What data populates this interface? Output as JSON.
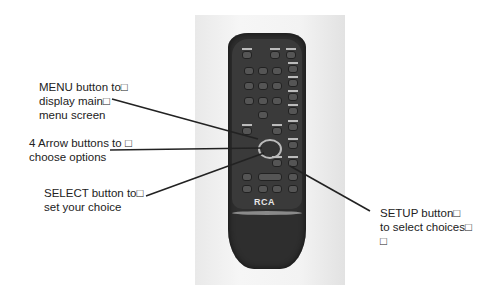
{
  "callouts": [
    {
      "id": "menu",
      "text": "MENU button to□\ndisplay main□\nmenu screen"
    },
    {
      "id": "arrows",
      "text": "4 Arrow buttons to □\nchoose options"
    },
    {
      "id": "select",
      "text": "SELECT button to□\nset your choice"
    },
    {
      "id": "setup",
      "text": "SETUP button□\nto select choices□\n□"
    }
  ],
  "remote": {
    "brand": "RCA",
    "icon": "remote-control-photo"
  },
  "colors": {
    "line": "#222222",
    "remote_body": "#2e2e2e",
    "background": "#ffffff"
  }
}
